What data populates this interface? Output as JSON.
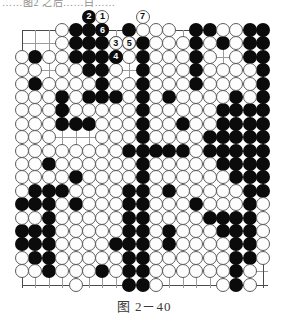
{
  "page": {
    "cropped_header_text": "……图2 之后……白……",
    "caption": "图 2－40"
  },
  "board": {
    "type": "go-board-diagram",
    "columns": 19,
    "rows": 20,
    "cell_px": 13.4,
    "colors": {
      "black": "#0b0b0b",
      "white": "#fdfdfd",
      "grid": "#9b9b9b",
      "edge": "#4a4a4a"
    },
    "hoshi": [
      [
        3,
        3
      ],
      [
        15,
        3
      ],
      [
        3,
        12
      ],
      [
        15,
        12
      ],
      [
        9,
        7
      ]
    ],
    "black_stones": [
      [
        4,
        0
      ],
      [
        5,
        0
      ],
      [
        8,
        0
      ],
      [
        13,
        0
      ],
      [
        14,
        0
      ],
      [
        17,
        0
      ],
      [
        18,
        0
      ],
      [
        4,
        1
      ],
      [
        5,
        1
      ],
      [
        6,
        1
      ],
      [
        8,
        1
      ],
      [
        9,
        1
      ],
      [
        13,
        1
      ],
      [
        15,
        1
      ],
      [
        17,
        1
      ],
      [
        18,
        1
      ],
      [
        1,
        2
      ],
      [
        4,
        2
      ],
      [
        5,
        2
      ],
      [
        6,
        2
      ],
      [
        9,
        2
      ],
      [
        13,
        2
      ],
      [
        17,
        2
      ],
      [
        18,
        2
      ],
      [
        5,
        3
      ],
      [
        6,
        3
      ],
      [
        9,
        3
      ],
      [
        13,
        3
      ],
      [
        18,
        3
      ],
      [
        1,
        4
      ],
      [
        6,
        4
      ],
      [
        9,
        4
      ],
      [
        13,
        4
      ],
      [
        18,
        4
      ],
      [
        3,
        5
      ],
      [
        5,
        5
      ],
      [
        6,
        5
      ],
      [
        7,
        5
      ],
      [
        9,
        5
      ],
      [
        11,
        5
      ],
      [
        16,
        5
      ],
      [
        18,
        5
      ],
      [
        3,
        6
      ],
      [
        9,
        6
      ],
      [
        15,
        6
      ],
      [
        16,
        6
      ],
      [
        17,
        6
      ],
      [
        18,
        6
      ],
      [
        3,
        6
      ],
      [
        9,
        7
      ],
      [
        12,
        7
      ],
      [
        15,
        7
      ],
      [
        16,
        7
      ],
      [
        17,
        7
      ],
      [
        18,
        7
      ],
      [
        3,
        7
      ],
      [
        4,
        7
      ],
      [
        5,
        7
      ],
      [
        9,
        8
      ],
      [
        14,
        8
      ],
      [
        15,
        8
      ],
      [
        16,
        8
      ],
      [
        17,
        8
      ],
      [
        18,
        8
      ],
      [
        8,
        9
      ],
      [
        9,
        9
      ],
      [
        10,
        9
      ],
      [
        11,
        9
      ],
      [
        12,
        9
      ],
      [
        14,
        9
      ],
      [
        15,
        9
      ],
      [
        16,
        9
      ],
      [
        17,
        9
      ],
      [
        18,
        9
      ],
      [
        2,
        10
      ],
      [
        9,
        10
      ],
      [
        15,
        10
      ],
      [
        16,
        10
      ],
      [
        17,
        10
      ],
      [
        18,
        10
      ],
      [
        4,
        11
      ],
      [
        9,
        11
      ],
      [
        16,
        11
      ],
      [
        17,
        11
      ],
      [
        18,
        11
      ],
      [
        1,
        12
      ],
      [
        2,
        12
      ],
      [
        3,
        12
      ],
      [
        8,
        12
      ],
      [
        9,
        12
      ],
      [
        11,
        12
      ],
      [
        17,
        12
      ],
      [
        18,
        12
      ],
      [
        0,
        13
      ],
      [
        1,
        13
      ],
      [
        2,
        13
      ],
      [
        4,
        13
      ],
      [
        8,
        13
      ],
      [
        9,
        13
      ],
      [
        13,
        13
      ],
      [
        17,
        13
      ],
      [
        2,
        14
      ],
      [
        8,
        14
      ],
      [
        9,
        14
      ],
      [
        14,
        14
      ],
      [
        15,
        14
      ],
      [
        16,
        14
      ],
      [
        17,
        14
      ],
      [
        0,
        15
      ],
      [
        1,
        15
      ],
      [
        2,
        15
      ],
      [
        8,
        15
      ],
      [
        9,
        15
      ],
      [
        11,
        15
      ],
      [
        15,
        15
      ],
      [
        16,
        15
      ],
      [
        17,
        15
      ],
      [
        0,
        16
      ],
      [
        1,
        16
      ],
      [
        2,
        16
      ],
      [
        7,
        16
      ],
      [
        8,
        16
      ],
      [
        9,
        16
      ],
      [
        11,
        16
      ],
      [
        16,
        16
      ],
      [
        17,
        16
      ],
      [
        1,
        17
      ],
      [
        2,
        17
      ],
      [
        8,
        17
      ],
      [
        9,
        17
      ],
      [
        16,
        17
      ],
      [
        17,
        17
      ],
      [
        2,
        18
      ],
      [
        6,
        18
      ],
      [
        8,
        18
      ],
      [
        9,
        18
      ],
      [
        16,
        18
      ],
      [
        8,
        19
      ],
      [
        9,
        19
      ],
      [
        16,
        19
      ]
    ],
    "white_stones": [
      [
        3,
        0
      ],
      [
        6,
        0
      ],
      [
        9,
        0
      ],
      [
        10,
        0
      ],
      [
        11,
        0
      ],
      [
        15,
        0
      ],
      [
        16,
        0
      ],
      [
        3,
        1
      ],
      [
        7,
        1
      ],
      [
        10,
        1
      ],
      [
        11,
        1
      ],
      [
        12,
        1
      ],
      [
        14,
        1
      ],
      [
        16,
        1
      ],
      [
        0,
        2
      ],
      [
        2,
        2
      ],
      [
        3,
        2
      ],
      [
        7,
        2
      ],
      [
        8,
        2
      ],
      [
        10,
        2
      ],
      [
        11,
        2
      ],
      [
        12,
        2
      ],
      [
        14,
        2
      ],
      [
        16,
        2
      ],
      [
        0,
        3
      ],
      [
        1,
        3
      ],
      [
        3,
        3
      ],
      [
        4,
        3
      ],
      [
        7,
        3
      ],
      [
        10,
        3
      ],
      [
        11,
        3
      ],
      [
        12,
        3
      ],
      [
        14,
        3
      ],
      [
        15,
        3
      ],
      [
        16,
        3
      ],
      [
        17,
        3
      ],
      [
        0,
        4
      ],
      [
        2,
        4
      ],
      [
        3,
        4
      ],
      [
        4,
        4
      ],
      [
        5,
        4
      ],
      [
        7,
        4
      ],
      [
        8,
        4
      ],
      [
        10,
        4
      ],
      [
        11,
        4
      ],
      [
        12,
        4
      ],
      [
        14,
        4
      ],
      [
        15,
        4
      ],
      [
        16,
        4
      ],
      [
        17,
        4
      ],
      [
        0,
        5
      ],
      [
        1,
        5
      ],
      [
        2,
        5
      ],
      [
        4,
        5
      ],
      [
        8,
        5
      ],
      [
        10,
        5
      ],
      [
        12,
        5
      ],
      [
        13,
        5
      ],
      [
        14,
        5
      ],
      [
        15,
        5
      ],
      [
        17,
        5
      ],
      [
        0,
        6
      ],
      [
        1,
        6
      ],
      [
        2,
        6
      ],
      [
        4,
        6
      ],
      [
        5,
        6
      ],
      [
        6,
        6
      ],
      [
        7,
        6
      ],
      [
        8,
        6
      ],
      [
        10,
        6
      ],
      [
        11,
        6
      ],
      [
        12,
        6
      ],
      [
        13,
        6
      ],
      [
        14,
        6
      ],
      [
        0,
        7
      ],
      [
        1,
        7
      ],
      [
        2,
        7
      ],
      [
        6,
        7
      ],
      [
        7,
        7
      ],
      [
        8,
        7
      ],
      [
        10,
        7
      ],
      [
        11,
        7
      ],
      [
        13,
        7
      ],
      [
        14,
        7
      ],
      [
        0,
        8
      ],
      [
        1,
        8
      ],
      [
        2,
        8
      ],
      [
        6,
        8
      ],
      [
        7,
        8
      ],
      [
        8,
        8
      ],
      [
        10,
        8
      ],
      [
        11,
        8
      ],
      [
        12,
        8
      ],
      [
        13,
        8
      ],
      [
        0,
        9
      ],
      [
        1,
        9
      ],
      [
        2,
        9
      ],
      [
        3,
        9
      ],
      [
        4,
        9
      ],
      [
        5,
        9
      ],
      [
        6,
        9
      ],
      [
        7,
        9
      ],
      [
        13,
        9
      ],
      [
        0,
        10
      ],
      [
        1,
        10
      ],
      [
        3,
        10
      ],
      [
        4,
        10
      ],
      [
        5,
        10
      ],
      [
        6,
        10
      ],
      [
        7,
        10
      ],
      [
        8,
        10
      ],
      [
        10,
        10
      ],
      [
        11,
        10
      ],
      [
        12,
        10
      ],
      [
        13,
        10
      ],
      [
        14,
        10
      ],
      [
        0,
        11
      ],
      [
        1,
        11
      ],
      [
        2,
        11
      ],
      [
        3,
        11
      ],
      [
        5,
        11
      ],
      [
        6,
        11
      ],
      [
        7,
        11
      ],
      [
        8,
        11
      ],
      [
        10,
        11
      ],
      [
        11,
        11
      ],
      [
        12,
        11
      ],
      [
        13,
        11
      ],
      [
        14,
        11
      ],
      [
        15,
        11
      ],
      [
        0,
        12
      ],
      [
        4,
        12
      ],
      [
        5,
        12
      ],
      [
        6,
        12
      ],
      [
        7,
        12
      ],
      [
        10,
        12
      ],
      [
        12,
        12
      ],
      [
        13,
        12
      ],
      [
        14,
        12
      ],
      [
        15,
        12
      ],
      [
        16,
        12
      ],
      [
        3,
        13
      ],
      [
        5,
        13
      ],
      [
        6,
        13
      ],
      [
        7,
        13
      ],
      [
        10,
        13
      ],
      [
        11,
        13
      ],
      [
        12,
        13
      ],
      [
        14,
        13
      ],
      [
        15,
        13
      ],
      [
        16,
        13
      ],
      [
        18,
        13
      ],
      [
        0,
        14
      ],
      [
        1,
        14
      ],
      [
        3,
        14
      ],
      [
        4,
        14
      ],
      [
        5,
        14
      ],
      [
        6,
        14
      ],
      [
        7,
        14
      ],
      [
        10,
        14
      ],
      [
        11,
        14
      ],
      [
        12,
        14
      ],
      [
        13,
        14
      ],
      [
        18,
        14
      ],
      [
        3,
        15
      ],
      [
        4,
        15
      ],
      [
        5,
        15
      ],
      [
        6,
        15
      ],
      [
        7,
        15
      ],
      [
        10,
        15
      ],
      [
        12,
        15
      ],
      [
        13,
        15
      ],
      [
        14,
        15
      ],
      [
        18,
        15
      ],
      [
        3,
        16
      ],
      [
        4,
        16
      ],
      [
        5,
        16
      ],
      [
        6,
        16
      ],
      [
        10,
        16
      ],
      [
        12,
        16
      ],
      [
        13,
        16
      ],
      [
        14,
        16
      ],
      [
        15,
        16
      ],
      [
        18,
        16
      ],
      [
        0,
        17
      ],
      [
        3,
        17
      ],
      [
        4,
        17
      ],
      [
        5,
        17
      ],
      [
        6,
        17
      ],
      [
        7,
        17
      ],
      [
        10,
        17
      ],
      [
        11,
        17
      ],
      [
        12,
        17
      ],
      [
        13,
        17
      ],
      [
        14,
        17
      ],
      [
        15,
        17
      ],
      [
        18,
        17
      ],
      [
        0,
        18
      ],
      [
        1,
        18
      ],
      [
        3,
        18
      ],
      [
        4,
        18
      ],
      [
        5,
        18
      ],
      [
        7,
        18
      ],
      [
        10,
        18
      ],
      [
        11,
        18
      ],
      [
        12,
        18
      ],
      [
        13,
        18
      ],
      [
        14,
        18
      ],
      [
        15,
        18
      ],
      [
        17,
        18
      ],
      [
        4,
        19
      ],
      [
        10,
        19
      ],
      [
        15,
        19
      ],
      [
        17,
        19
      ]
    ],
    "numbered_moves": [
      {
        "label": "2",
        "color": "black",
        "col": 5,
        "row": -1
      },
      {
        "label": "1",
        "color": "white",
        "col": 6,
        "row": -1
      },
      {
        "label": "7",
        "color": "white",
        "col": 9,
        "row": -1
      },
      {
        "label": "6",
        "color": "black",
        "col": 6,
        "row": 0
      },
      {
        "label": "3",
        "color": "white",
        "col": 7,
        "row": 1
      },
      {
        "label": "5",
        "color": "white",
        "col": 8,
        "row": 1
      },
      {
        "label": "4",
        "color": "black",
        "col": 7,
        "row": 2
      }
    ]
  }
}
